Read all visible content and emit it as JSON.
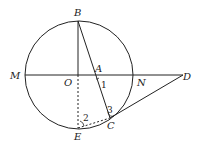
{
  "diagram": {
    "points": {
      "B": {
        "label": "B",
        "x": 78,
        "y": 21
      },
      "M": {
        "label": "M",
        "x": 25,
        "y": 75
      },
      "O": {
        "label": "O",
        "x": 78,
        "y": 75
      },
      "A": {
        "label": "A",
        "x": 95,
        "y": 75
      },
      "N": {
        "label": "N",
        "x": 136,
        "y": 75
      },
      "D": {
        "label": "D",
        "x": 183,
        "y": 75
      },
      "C": {
        "label": "C",
        "x": 110,
        "y": 118
      },
      "E": {
        "label": "E",
        "x": 78,
        "y": 128
      }
    },
    "angles": {
      "a1": "1",
      "a2": "2",
      "a3": "3"
    },
    "circle": {
      "center": "O",
      "r": 54
    }
  }
}
